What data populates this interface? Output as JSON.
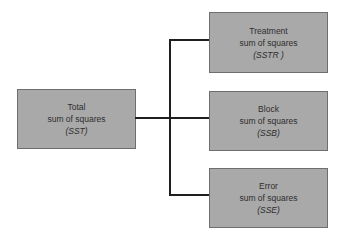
{
  "diagram": {
    "source": {
      "line1": "Total",
      "line2": "sum of squares",
      "abbr": "(SST)"
    },
    "components": [
      {
        "line1": "Treatment",
        "line2": "sum of squares",
        "abbr": "(SSTR )"
      },
      {
        "line1": "Block",
        "line2": "sum of squares",
        "abbr": "(SSB)"
      },
      {
        "line1": "Error",
        "line2": "sum of squares",
        "abbr": "(SSE)"
      }
    ],
    "colors": {
      "box_fill": "#a9a9a9",
      "box_border": "#6e6e6e",
      "connector": "#1f1f1f",
      "text": "#2e2e2e"
    }
  }
}
